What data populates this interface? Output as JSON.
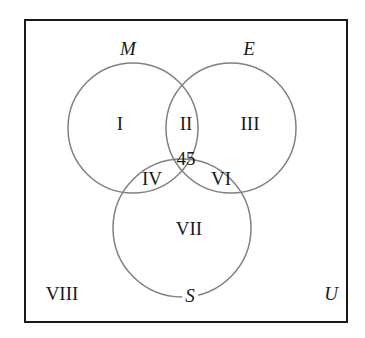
{
  "figure": {
    "type": "venn-diagram-3-set",
    "width": 365,
    "height": 338,
    "background_color": "#ffffff"
  },
  "universe": {
    "label": "U",
    "name": "universal-set",
    "border_color": "#1a1a1a",
    "border_width": 2,
    "rect": {
      "x": 25,
      "y": 20,
      "width": 322,
      "height": 302
    },
    "label_position": {
      "x": 331,
      "y": 293
    }
  },
  "circles": [
    {
      "id": "M",
      "label": "M",
      "name": "circle-m",
      "cx": 133,
      "cy": 128,
      "r": 65,
      "stroke": "#808080",
      "label_position": {
        "x": 128,
        "y": 48
      }
    },
    {
      "id": "E",
      "label": "E",
      "name": "circle-e",
      "cx": 231,
      "cy": 128,
      "r": 65,
      "stroke": "#808080",
      "label_position": {
        "x": 249,
        "y": 48
      }
    },
    {
      "id": "S",
      "label": "S",
      "name": "circle-s",
      "cx": 182,
      "cy": 228,
      "r": 69,
      "stroke": "#808080",
      "label_position": {
        "x": 190,
        "y": 295
      }
    }
  ],
  "regions": [
    {
      "id": "I",
      "label": "I",
      "name": "region-m-only",
      "x": 120,
      "y": 123
    },
    {
      "id": "II",
      "label": "II",
      "name": "region-m-and-e",
      "x": 186,
      "y": 123
    },
    {
      "id": "III",
      "label": "III",
      "name": "region-e-only",
      "x": 250,
      "y": 123
    },
    {
      "id": "IV",
      "label": "IV",
      "name": "region-m-and-s",
      "x": 152,
      "y": 178
    },
    {
      "id": "V",
      "label": "45",
      "name": "region-m-and-e-and-s",
      "x": 186,
      "y": 158
    },
    {
      "id": "VI",
      "label": "VI",
      "name": "region-e-and-s",
      "x": 221,
      "y": 178
    },
    {
      "id": "VII",
      "label": "VII",
      "name": "region-s-only",
      "x": 189,
      "y": 228
    },
    {
      "id": "VIII",
      "label": "VIII",
      "name": "region-outside-all",
      "x": 62,
      "y": 293
    }
  ]
}
